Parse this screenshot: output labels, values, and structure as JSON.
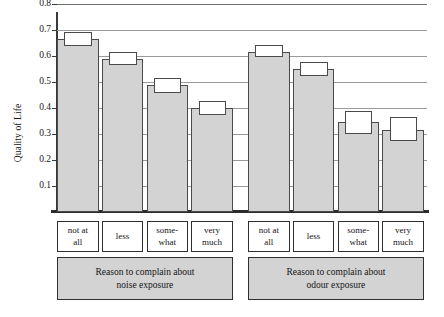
{
  "chart_data": {
    "type": "bar",
    "title": "",
    "xlabel": "",
    "ylabel": "Quality of Life",
    "ylim": [
      0.0,
      0.8
    ],
    "grid": true,
    "legend": false,
    "categories": [
      "not at all",
      "less",
      "some-what",
      "very much",
      "not at all",
      "less",
      "some-what",
      "very much"
    ],
    "values": [
      0.665,
      0.59,
      0.487,
      0.4,
      0.617,
      0.55,
      0.345,
      0.317
    ],
    "error_bars": {
      "style": "confidence-interval-box",
      "lower": [
        0.64,
        0.565,
        0.458,
        0.372,
        0.595,
        0.523,
        0.3,
        0.272
      ],
      "upper": [
        0.692,
        0.615,
        0.515,
        0.428,
        0.642,
        0.578,
        0.39,
        0.365
      ]
    },
    "groups": [
      {
        "label_line1": "Reason to complain about",
        "label_line2": "noise exposure",
        "categories": [
          "not at all",
          "less",
          "some-what",
          "very much"
        ],
        "values": [
          0.665,
          0.59,
          0.487,
          0.4
        ]
      },
      {
        "label_line1": "Reason to complain about",
        "label_line2": "odour exposure",
        "categories": [
          "not at all",
          "less",
          "some-what",
          "very much"
        ],
        "values": [
          0.617,
          0.55,
          0.345,
          0.317
        ]
      }
    ],
    "yticks": [
      "0.8",
      "0.7",
      "0.6",
      "0.5",
      "0.4",
      "0.3",
      "0.2",
      "0.1"
    ],
    "colors": {
      "bar_fill": "#d3d3d3",
      "bar_border": "#4a4a4a",
      "ci_fill": "#ffffff",
      "gridline": "#6e6e6e",
      "axis": "#2b2b2b",
      "band_fill": "#d3d3d3",
      "text": "#141414",
      "background": "#ffffff"
    }
  },
  "axis": {
    "y_title": "Quality of Life"
  },
  "ticks": [
    {
      "label": "0.8"
    },
    {
      "label": "0.7"
    },
    {
      "label": "0.6"
    },
    {
      "label": "0.5"
    },
    {
      "label": "0.4"
    },
    {
      "label": "0.3"
    },
    {
      "label": "0.2"
    },
    {
      "label": "0.1"
    }
  ],
  "categories": [
    {
      "line1": "not at",
      "line2": "all"
    },
    {
      "line1": "less",
      "line2": ""
    },
    {
      "line1": "some-",
      "line2": "what"
    },
    {
      "line1": "very",
      "line2": "much"
    },
    {
      "line1": "not at",
      "line2": "all"
    },
    {
      "line1": "less",
      "line2": ""
    },
    {
      "line1": "some-",
      "line2": "what"
    },
    {
      "line1": "very",
      "line2": "much"
    }
  ],
  "groups": [
    {
      "line1": "Reason to complain about",
      "line2": "noise exposure"
    },
    {
      "line1": "Reason to complain about",
      "line2": "odour exposure"
    }
  ]
}
